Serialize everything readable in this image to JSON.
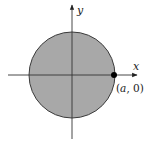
{
  "diagram": {
    "type": "filled-disk-on-axes",
    "circle": {
      "cx": 72,
      "cy": 75,
      "r": 43,
      "fill": "#a8a8a8",
      "stroke": "#3a3a3a"
    },
    "axes": {
      "x_label": "x",
      "y_label": "y",
      "color": "#333333"
    },
    "point": {
      "label": "(a, 0)",
      "label_var": "a",
      "label_open": "(",
      "label_rest": ", 0)",
      "x": 114,
      "y": 75,
      "color": "#000000"
    }
  }
}
